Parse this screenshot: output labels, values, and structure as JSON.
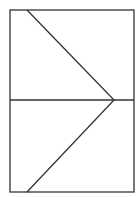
{
  "diagram": {
    "stroke_color": "#333333",
    "background": "#ffffff",
    "frame": {
      "x": 10,
      "y": 10,
      "width": 124,
      "height": 182
    },
    "divider": {
      "x1": 10,
      "y1": 100,
      "x2": 134,
      "y2": 100
    },
    "chevron": {
      "top_start": {
        "x": 27,
        "y": 10
      },
      "apex": {
        "x": 114,
        "y": 100
      },
      "bottom_end": {
        "x": 27,
        "y": 192
      }
    }
  }
}
